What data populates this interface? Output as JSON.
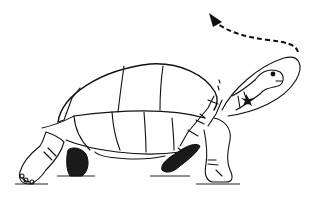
{
  "illustration": {
    "subject": "tortoise line drawing",
    "description": "Tortoise walking with neck extended upward and forward; dashed arrow curving from head upward-left",
    "colors": {
      "stroke": "#111111",
      "background": "#ffffff",
      "shaded_legs": "#1a1a1a"
    },
    "elements": [
      "shell",
      "head",
      "neck",
      "front-left-leg",
      "front-right-leg",
      "hind-left-leg",
      "hind-right-leg",
      "dashed-arrow",
      "ground-lines"
    ]
  }
}
